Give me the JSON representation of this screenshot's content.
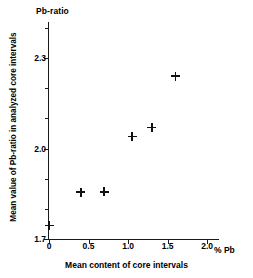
{
  "chart_data": {
    "type": "scatter",
    "title": "Pb-ratio",
    "xlabel": "Mean content of core intervals",
    "ylabel": "Mean value of Pb-ratio in analyzed core intervals",
    "xunit": "% Pb",
    "xlim": [
      0,
      2.15
    ],
    "ylim": [
      1.7,
      2.42
    ],
    "grid": false,
    "legend": null,
    "xticks": [
      {
        "value": 0,
        "label": "0",
        "major": true
      },
      {
        "value": 0.5,
        "label": "0.5",
        "major": true
      },
      {
        "value": 1.0,
        "label": "1.0",
        "major": true
      },
      {
        "value": 1.5,
        "label": "1.5",
        "major": true
      },
      {
        "value": 2.0,
        "label": "2.0",
        "major": true
      }
    ],
    "yticks": [
      {
        "value": 1.7,
        "label": "1.7",
        "major": true
      },
      {
        "value": 1.8,
        "label": "",
        "major": false
      },
      {
        "value": 1.9,
        "label": "",
        "major": false
      },
      {
        "value": 2.0,
        "label": "2.0",
        "major": true
      },
      {
        "value": 2.1,
        "label": "",
        "major": false
      },
      {
        "value": 2.2,
        "label": "",
        "major": false
      },
      {
        "value": 2.3,
        "label": "2.3",
        "major": true
      },
      {
        "value": 2.4,
        "label": "",
        "major": false
      }
    ],
    "points": [
      {
        "x": 0.0,
        "y": 1.745
      },
      {
        "x": 0.4,
        "y": 1.855
      },
      {
        "x": 0.7,
        "y": 1.857
      },
      {
        "x": 1.05,
        "y": 2.04
      },
      {
        "x": 1.3,
        "y": 2.07
      },
      {
        "x": 1.6,
        "y": 2.24
      }
    ],
    "marker": "plus"
  }
}
